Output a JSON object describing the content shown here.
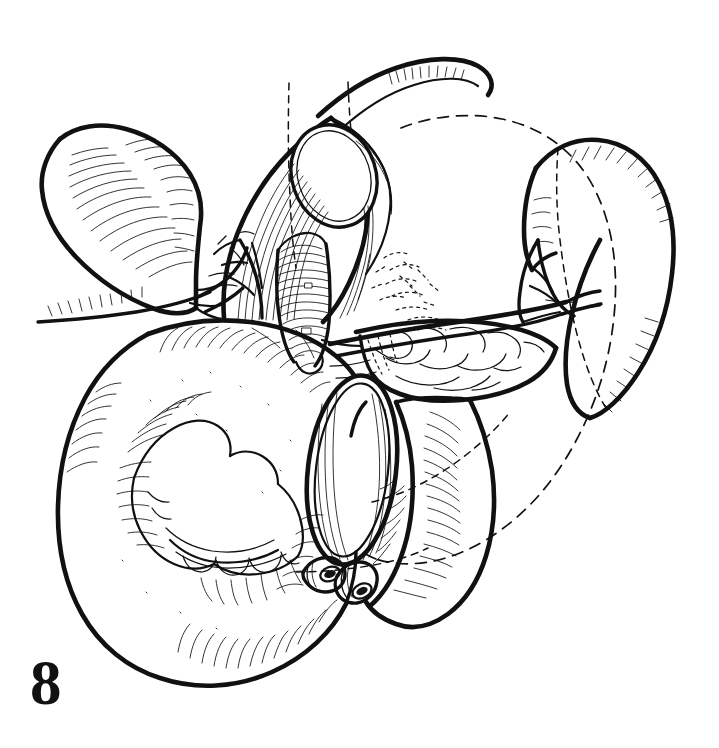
{
  "figure": {
    "number": "8",
    "caption": "",
    "domain_kind": "anatomical line illustration",
    "background_color": "#ffffff",
    "ink_color": "#111111",
    "canvas": {
      "width": 719,
      "height": 748
    }
  },
  "render": {
    "style": "pen-and-ink hatched line drawing, no color, no shading tones",
    "stroke_colors": {
      "outline_heavy": "#111111",
      "outline_medium": "#1a1a1a",
      "hatching": "#222222",
      "dashed_guide": "#222222"
    }
  },
  "structures": [
    {
      "id": "gallbladder",
      "label": "gallbladder",
      "position": "upper-left",
      "note": "pear-shaped organ with fine hatching along its lower border, neck directed right toward the porta"
    },
    {
      "id": "cystic-duct-stump",
      "label": "cystic duct",
      "position": "upper-left-center",
      "note": "thin duct leaving gallbladder neck"
    },
    {
      "id": "porta-hepatis",
      "label": "porta hepatis dissection",
      "position": "upper-center",
      "note": "opened hepatoduodenal ligament with longitudinal striations framing an oval window"
    },
    {
      "id": "bile-duct",
      "label": "common bile duct",
      "position": "center",
      "note": "vertical ribbed duct within the dissected field"
    },
    {
      "id": "portal-vein",
      "label": "portal vein",
      "position": "center",
      "note": "broad vessel running behind the duct"
    },
    {
      "id": "hepatic-artery",
      "label": "hepatic artery branches",
      "position": "left-of-center",
      "note": "branching arterial tree with bold outlines"
    },
    {
      "id": "stomach-transected",
      "label": "transected stomach",
      "position": "lower-left",
      "note": "large globular viscus, hatched serosa, rugal folds visible, cut end presented as an ellipse"
    },
    {
      "id": "stomach-lumen",
      "label": "open gastric lumen",
      "position": "center-lower",
      "note": "elliptical cut opening with striated inner wall"
    },
    {
      "id": "gastric-mucosal-folds",
      "label": "gastric mucosa / rugae",
      "position": "lower-left-center",
      "note": "scalloped folded tissue inside the opened stomach"
    },
    {
      "id": "pancreas",
      "label": "pancreas body and tail",
      "position": "center-right",
      "note": "lobulated gland extending toward the splenic hilum"
    },
    {
      "id": "splenic-vessels",
      "label": "splenic artery and vein",
      "position": "right-of-center",
      "note": "bold vessels crossing above the pancreas to the hilum"
    },
    {
      "id": "spleen",
      "label": "spleen",
      "position": "right",
      "note": "crescentic organ with hatched capsular margin and dashed hidden border"
    },
    {
      "id": "duodenum-jejunum",
      "label": "duodenum / proximal jejunum",
      "position": "lower-right",
      "note": "tubular bowel loop with transverse hatching"
    },
    {
      "id": "jejunal-limb",
      "label": "efferent limb",
      "position": "top",
      "note": "curved tube sweeping off the top of the field"
    },
    {
      "id": "vessel-stumps",
      "label": "cut vessel stumps",
      "position": "bottom-center",
      "note": "two transected tubes with dark open lumens"
    },
    {
      "id": "resection-outline",
      "label": "resection outline",
      "position": "center-right",
      "note": "large dashed circle marking the removed specimen boundary"
    },
    {
      "id": "transection-markers",
      "label": "transection plane markers",
      "position": "top-center",
      "note": "two short vertical dashed lines indicating the division level"
    }
  ],
  "annotations": {
    "dashed_guides_meaning": "dashed contours indicate hidden or removed structures and planned lines of division",
    "visible_text_items": [
      "8"
    ]
  }
}
